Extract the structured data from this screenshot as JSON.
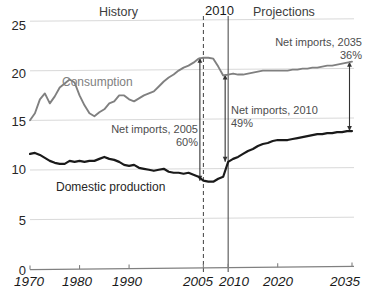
{
  "chart_data": {
    "type": "line",
    "title": "",
    "xlabel": "",
    "ylabel": "",
    "xlim": [
      1970,
      2035
    ],
    "ylim": [
      0,
      25
    ],
    "grid": true,
    "legend_position": "inline-annotations",
    "y_ticks": [
      "0",
      "5",
      "10",
      "15",
      "20",
      "25"
    ],
    "y_tick_values": [
      0,
      5,
      10,
      15,
      20,
      25
    ],
    "x_ticks": [
      "1970",
      "1980",
      "1990",
      "2005",
      "2010",
      "2020",
      "2035"
    ],
    "x_tick_values": [
      1970,
      1980,
      1990,
      2005,
      2010,
      2020,
      2035
    ],
    "region_labels": [
      {
        "name": "history",
        "text": "History"
      },
      {
        "name": "projections",
        "text": "Projections"
      },
      {
        "name": "divider-year",
        "text": "2010"
      }
    ],
    "markers": [
      {
        "name": "marker-2005",
        "year": 2005,
        "style": "dashed"
      },
      {
        "name": "marker-2010",
        "year": 2010,
        "style": "solid"
      }
    ],
    "series": [
      {
        "name": "Consumption",
        "color": "#808080",
        "x": [
          1970,
          1971,
          1972,
          1973,
          1974,
          1975,
          1976,
          1977,
          1978,
          1979,
          1980,
          1981,
          1982,
          1983,
          1984,
          1985,
          1986,
          1987,
          1988,
          1989,
          1990,
          1991,
          1992,
          1993,
          1994,
          1995,
          1996,
          1997,
          1998,
          1999,
          2000,
          2001,
          2002,
          2003,
          2004,
          2005,
          2006,
          2007,
          2008,
          2009,
          2010,
          2011,
          2012,
          2013,
          2014,
          2015,
          2016,
          2017,
          2018,
          2019,
          2020,
          2021,
          2022,
          2023,
          2024,
          2025,
          2026,
          2027,
          2028,
          2029,
          2030,
          2031,
          2032,
          2033,
          2034,
          2035
        ],
        "y": [
          14.9,
          15.6,
          17.0,
          17.6,
          16.6,
          17.3,
          18.2,
          18.6,
          19.0,
          18.7,
          17.4,
          16.4,
          15.6,
          15.3,
          15.7,
          16.0,
          16.6,
          16.8,
          17.4,
          17.4,
          17.0,
          16.8,
          17.1,
          17.4,
          17.6,
          17.8,
          18.3,
          18.8,
          19.2,
          19.5,
          19.9,
          20.2,
          20.4,
          20.7,
          21.1,
          21.2,
          21.2,
          21.1,
          20.3,
          19.4,
          19.5,
          19.6,
          19.5,
          19.5,
          19.6,
          19.7,
          19.8,
          19.9,
          19.9,
          19.9,
          19.9,
          19.9,
          19.9,
          20.0,
          20.0,
          20.1,
          20.1,
          20.2,
          20.2,
          20.3,
          20.4,
          20.4,
          20.5,
          20.6,
          20.7,
          20.8
        ],
        "label": "Consumption"
      },
      {
        "name": "Domestic production",
        "color": "#1a1a1a",
        "x": [
          1970,
          1971,
          1972,
          1973,
          1974,
          1975,
          1976,
          1977,
          1978,
          1979,
          1980,
          1981,
          1982,
          1983,
          1984,
          1985,
          1986,
          1987,
          1988,
          1989,
          1990,
          1991,
          1992,
          1993,
          1994,
          1995,
          1996,
          1997,
          1998,
          1999,
          2000,
          2001,
          2002,
          2003,
          2004,
          2005,
          2006,
          2007,
          2008,
          2009,
          2010,
          2011,
          2012,
          2013,
          2014,
          2015,
          2016,
          2017,
          2018,
          2019,
          2020,
          2021,
          2022,
          2023,
          2024,
          2025,
          2026,
          2027,
          2028,
          2029,
          2030,
          2031,
          2032,
          2033,
          2034,
          2035
        ],
        "y": [
          11.5,
          11.6,
          11.4,
          11.1,
          10.8,
          10.6,
          10.5,
          10.5,
          10.8,
          10.7,
          10.8,
          10.7,
          10.8,
          10.8,
          11.0,
          11.2,
          11.0,
          10.9,
          10.7,
          10.4,
          10.3,
          10.4,
          10.1,
          10.0,
          9.9,
          9.8,
          9.9,
          10.0,
          9.7,
          9.6,
          9.6,
          9.5,
          9.6,
          9.4,
          9.2,
          8.8,
          8.7,
          8.7,
          9.0,
          9.2,
          10.7,
          11.0,
          11.2,
          11.5,
          11.8,
          12.0,
          12.3,
          12.5,
          12.6,
          12.8,
          12.9,
          12.9,
          12.9,
          13.0,
          13.1,
          13.2,
          13.3,
          13.4,
          13.5,
          13.5,
          13.6,
          13.6,
          13.7,
          13.7,
          13.8,
          13.8
        ],
        "label": "Domestic production"
      }
    ],
    "annotations": [
      {
        "name": "net-imports-2005",
        "line1": "Net imports, 2005",
        "line2": "60%",
        "year": 2005
      },
      {
        "name": "net-imports-2010",
        "line1": "Net imports, 2010",
        "line2": "49%",
        "year": 2010
      },
      {
        "name": "net-imports-2035",
        "line1": "Net imports, 2035",
        "line2": "36%",
        "year": 2035
      }
    ],
    "colors": {
      "consumption": "#808080",
      "domestic_production": "#1a1a1a",
      "grid": "#d9d9d9",
      "axis": "#808080",
      "text": "#4d4d4d"
    }
  }
}
